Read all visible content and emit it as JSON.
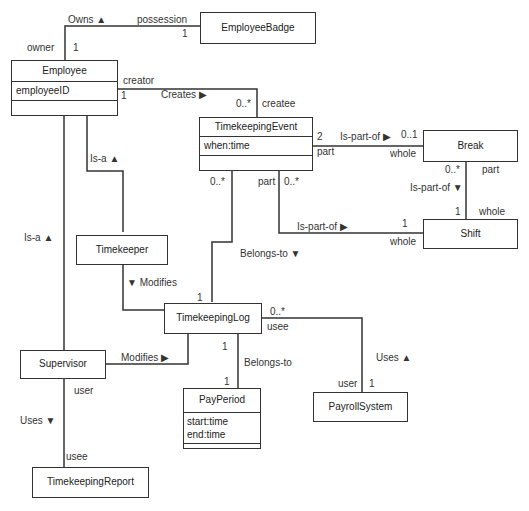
{
  "diagram": {
    "type": "UML class diagram",
    "classes": {
      "employee_badge": {
        "name": "EmployeeBadge"
      },
      "employee": {
        "name": "Employee",
        "attributes": [
          "employeeID"
        ]
      },
      "timekeeping_event": {
        "name": "TimekeepingEvent",
        "attributes": [
          "when:time"
        ]
      },
      "break": {
        "name": "Break"
      },
      "shift": {
        "name": "Shift"
      },
      "timekeeper": {
        "name": "Timekeeper"
      },
      "timekeeping_log": {
        "name": "TimekeepingLog"
      },
      "supervisor": {
        "name": "Supervisor"
      },
      "pay_period": {
        "name": "PayPeriod",
        "attributes": [
          "start:time",
          "end:time"
        ]
      },
      "payroll_system": {
        "name": "PayrollSystem"
      },
      "timekeeping_report": {
        "name": "TimekeepingReport"
      }
    },
    "labels": {
      "owns": "Owns ▲",
      "possession": "possession",
      "owner": "owner",
      "owns_mult_employee": "1",
      "owns_mult_badge": "1",
      "creator": "creator",
      "creates": "Creates ▶",
      "creates_mult_employee": "1",
      "creates_mult_event": "0..*",
      "createe": "createe",
      "isa_timekeeper": "Is-a ▲",
      "isa_supervisor": "Is-a ▲",
      "event_break_mult_event": "2",
      "event_break_assoc": "Is-part-of ▶",
      "event_break_mult_break": "0..1",
      "event_break_part": "part",
      "event_break_whole": "whole",
      "event_log_mult": "0..*",
      "event_shift_part": "part",
      "event_shift_mult": "0..*",
      "event_shift_assoc": "Is-part-of ▶",
      "event_shift_mult_shift": "1",
      "event_shift_whole": "whole",
      "break_shift_mult_break": "0..*",
      "break_shift_part": "part",
      "break_shift_assoc": "Is-part-of ▼",
      "break_shift_mult_shift": "1",
      "break_shift_whole": "whole",
      "belongs_to_event_log": "Belongs-to ▼",
      "log_mult_event_side": "1",
      "timekeeper_modifies": "▼ Modifies",
      "supervisor_modifies": "Modifies ▶",
      "log_payroll_mult": "0..*",
      "log_usee": "usee",
      "log_period_mult_log": "1",
      "belongs_to_period": "Belongs-to",
      "log_period_mult_period": "1",
      "payroll_uses": "Uses ▲",
      "payroll_user": "user",
      "payroll_mult": "1",
      "supervisor_user": "user",
      "supervisor_uses": "Uses ▼",
      "report_usee": "usee"
    },
    "colors": {
      "line": "#333333",
      "background": "#ffffff"
    }
  }
}
